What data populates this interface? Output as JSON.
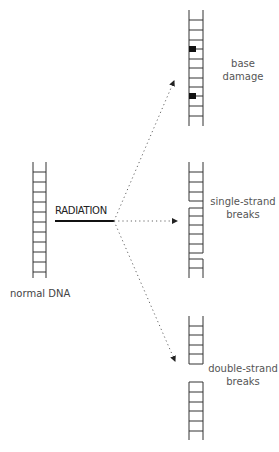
{
  "diagram": {
    "source_label": "normal DNA",
    "agent_label": "RADIATION",
    "outcomes": [
      {
        "id": "base-damage",
        "line1": "base",
        "line2": "damage"
      },
      {
        "id": "single-strand-breaks",
        "line1": "single-strand",
        "line2": "breaks"
      },
      {
        "id": "double-strand-breaks",
        "line1": "double-strand",
        "line2": "breaks"
      }
    ],
    "colors": {
      "ladder": "#333333",
      "damage_mark": "#111111",
      "arrow": "#555555",
      "label_text": "#555555"
    }
  }
}
